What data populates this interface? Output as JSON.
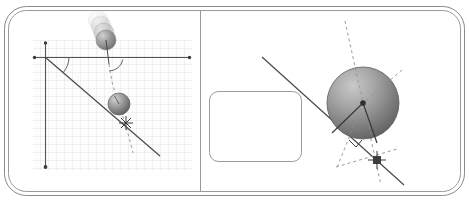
{
  "figure": {
    "canvas": {
      "width": 469,
      "height": 207
    },
    "background_color": "#ffffff"
  },
  "frame": {
    "name": "rounded-double-border-frame",
    "outer": {
      "x": 4,
      "y": 6,
      "width": 461,
      "height": 190,
      "radius": 22
    },
    "inner": {
      "x": 8,
      "y": 10,
      "width": 453,
      "height": 182,
      "radius": 18
    },
    "stroke_color": "#8a8a8a",
    "stroke_width": 1,
    "divider": {
      "name": "panel-divider",
      "x": 200,
      "y1": 10,
      "y2": 192,
      "stroke_color": "#9a9a9a"
    }
  },
  "left_panel": {
    "name": "projectile-on-incline-panel",
    "grid": {
      "name": "graph-paper-grid",
      "x": 33,
      "y": 40,
      "width": 159,
      "height": 130,
      "cell_size": 8,
      "line_color": "#d8d2d2",
      "background_color": "#fdfdfd"
    },
    "axes": {
      "horizontal": {
        "name": "x-axis",
        "x1": 33,
        "y1": 57,
        "x2": 191,
        "y2": 57,
        "color": "#555555",
        "endpoint_dot_left": {
          "x": 34,
          "y": 57
        },
        "endpoint_dot_right": {
          "x": 190,
          "y": 57
        }
      },
      "vertical": {
        "name": "y-axis",
        "x1": 45,
        "y1": 42,
        "x2": 45,
        "y2": 168,
        "color": "#555555",
        "endpoint_dot_top": {
          "x": 45,
          "y": 43
        },
        "endpoint_dot_bottom": {
          "x": 45,
          "y": 167
        }
      }
    },
    "incline_line": {
      "name": "inclined-plane-line",
      "x1": 45,
      "y1": 57,
      "x2": 160,
      "y2": 156,
      "color": "#4a4a4a",
      "stroke_width": 1.2
    },
    "incline_angle_arc": {
      "name": "incline-angle-arc",
      "center": {
        "x": 45,
        "y": 57
      },
      "radius": 24,
      "start_deg": 0,
      "end_deg": 40,
      "color": "#555555"
    },
    "motion_trail": {
      "name": "projectile-motion-trail",
      "spheres": [
        {
          "cx": 98,
          "cy": 20,
          "r": 10,
          "opacity": 0.16
        },
        {
          "cx": 101,
          "cy": 26,
          "r": 10,
          "opacity": 0.32
        },
        {
          "cx": 104,
          "cy": 33,
          "r": 10,
          "opacity": 0.55
        },
        {
          "cx": 106,
          "cy": 40,
          "r": 10,
          "opacity": 0.85
        }
      ],
      "base_color": "#8e8e8e"
    },
    "launch_velocity_vector": {
      "name": "launch-velocity-vector",
      "x1": 106,
      "y1": 40,
      "x2": 109,
      "y2": 62,
      "color": "#4a4a4a"
    },
    "launch_angle_arc": {
      "name": "launch-angle-arc",
      "center": {
        "x": 109,
        "y": 57
      },
      "radius": 14,
      "start_deg": 0,
      "end_deg": 78,
      "color": "#555555"
    },
    "trajectory_dashed": {
      "name": "trajectory-dashed-path",
      "points": "109,62 112,82 118,100 124,118 130,136 133,152",
      "color": "#9b9b9b",
      "dash": "3 3"
    },
    "falling_sphere": {
      "name": "falling-sphere",
      "cx": 119,
      "cy": 104,
      "r": 11,
      "fill_light": "#b9b9b9",
      "fill_dark": "#6f6f6f",
      "radius_line": {
        "x1": 119,
        "y1": 104,
        "x2": 115,
        "y2": 96
      }
    },
    "impact_marker": {
      "name": "impact-point-marker",
      "cx": 126,
      "cy": 123,
      "size": 7,
      "color": "#3a3a3a"
    }
  },
  "right_panel": {
    "name": "sphere-contact-normal-panel",
    "placeholder_box": {
      "name": "empty-annotation-box",
      "x": 209,
      "y": 91,
      "width": 92,
      "height": 70,
      "radius": 9,
      "stroke_color": "#9a9a9a",
      "fill": "#ffffff"
    },
    "incline_line": {
      "name": "inclined-surface-line",
      "x1": 262,
      "y1": 57,
      "x2": 404,
      "y2": 185,
      "color": "#4a4a4a",
      "stroke_width": 1.2
    },
    "sphere": {
      "name": "large-sphere",
      "cx": 363,
      "cy": 103,
      "r": 36,
      "fill_light": "#b4b4b4",
      "fill_dark": "#6a6a6a",
      "center_dot": {
        "x": 363,
        "y": 103,
        "r": 2.6
      }
    },
    "radius_vectors": {
      "name": "radius-vectors-from-center",
      "lines": [
        {
          "x1": 363,
          "y1": 103,
          "x2": 333,
          "y2": 132
        },
        {
          "x1": 363,
          "y1": 103,
          "x2": 377,
          "y2": 142
        }
      ],
      "color": "#3a3a3a"
    },
    "dashed_lines": {
      "name": "construction-dashed-lines",
      "dash": "3 3",
      "color": "#9b9b9b",
      "segments": [
        {
          "name": "vertical-dashed-through-center",
          "x1": 345,
          "y1": 21,
          "x2": 381,
          "y2": 185
        },
        {
          "name": "diagonal-dashed-upper-right",
          "x1": 400,
          "y1": 72,
          "x2": 363,
          "y2": 103
        },
        {
          "name": "normal-dashed-lower-left",
          "x1": 363,
          "y1": 103,
          "x2": 338,
          "y2": 168
        },
        {
          "name": "tangent-dashed-left",
          "x1": 337,
          "y1": 166,
          "x2": 395,
          "y2": 150
        }
      ]
    },
    "contact_marker": {
      "name": "contact-point-marker",
      "cx": 377,
      "cy": 160,
      "size": 6,
      "color": "#3a3a3a"
    },
    "right_angle_mark": {
      "name": "right-angle-symbol",
      "points": "349,141 355,148 361,141",
      "color": "#3a3a3a"
    }
  },
  "palette": {
    "frame_stroke": "#8a8a8a",
    "grid_line": "#d8d2d2",
    "axis": "#555555",
    "solid_line": "#4a4a4a",
    "dashed_line": "#9b9b9b",
    "sphere_light": "#b9b9b9",
    "sphere_dark": "#6a6a6a",
    "marker": "#3a3a3a"
  }
}
